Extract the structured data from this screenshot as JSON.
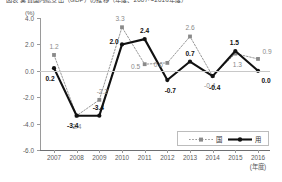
{
  "chart_data": {
    "type": "line",
    "title": "図表 実質国内総支出（GDP）の推移（年度、2007～2016年度）",
    "unit_label": "(%)",
    "xlabel": "(年度)",
    "ylabel": "",
    "ylim": [
      -6.0,
      4.0
    ],
    "ytick_values": [
      4.0,
      2.0,
      0.0,
      -2.0,
      -4.0,
      -6.0
    ],
    "ytick_labels": [
      "4.0",
      "2.0",
      "0.0",
      "-2.0",
      "-4.0",
      "-6.0"
    ],
    "categories": [
      "2007",
      "2008",
      "2009",
      "2010",
      "2011",
      "2012",
      "2013",
      "2014",
      "2015",
      "2016"
    ],
    "grid": false,
    "legend_position": "bottom-right",
    "series": [
      {
        "name": "国",
        "style": "dotted",
        "color": "#8a8a8a",
        "marker": "square",
        "values": [
          1.2,
          -3.4,
          -2.2,
          3.3,
          0.5,
          0.6,
          2.6,
          -0.4,
          1.3,
          0.9
        ],
        "labels": [
          "1.2",
          "-3.4",
          "-2.2",
          "3.3",
          "0.5",
          "0.6",
          "2.6",
          "-0.4",
          "1.3",
          "0.9"
        ]
      },
      {
        "name": "用",
        "style": "solid",
        "color": "#111111",
        "marker": "circle",
        "values": [
          0.2,
          -3.4,
          -3.4,
          2.0,
          2.4,
          -0.7,
          0.7,
          -0.4,
          1.5,
          0.0
        ],
        "labels": [
          "0.2",
          "-3.4",
          "-3.4",
          "2.0",
          "2.4",
          "-0.7",
          "0.7",
          "-0.4",
          "1.5",
          "0.0"
        ]
      }
    ]
  }
}
